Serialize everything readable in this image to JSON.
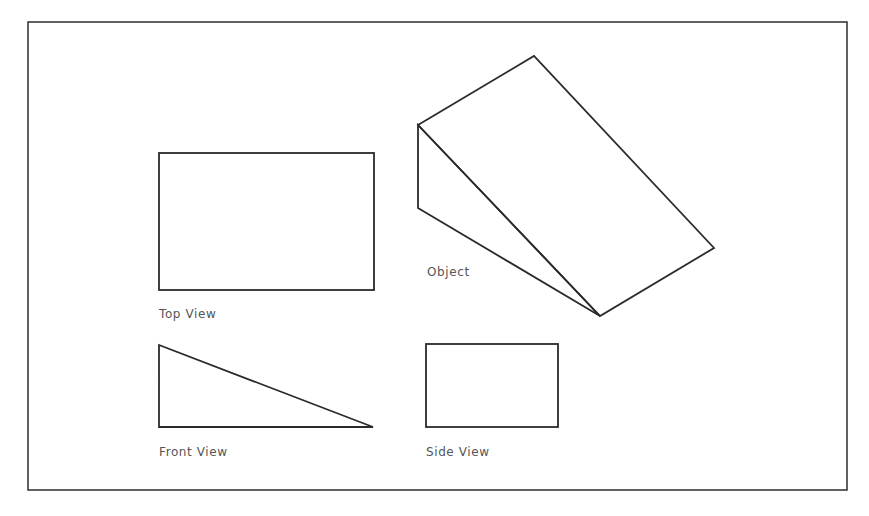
{
  "drawing": {
    "colors": {
      "stroke": "#2b2b2b",
      "frame": "#3a3a3a",
      "label": "#555555",
      "background": "#ffffff"
    },
    "labels": {
      "top_view": "Top View",
      "front_view": "Front View",
      "side_view": "Side View",
      "object": "Object"
    }
  }
}
